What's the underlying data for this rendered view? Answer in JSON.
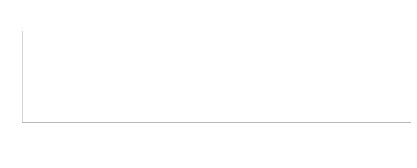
{
  "chart_data": {
    "type": "bar",
    "subtitle": "Completed surveys ranged from 201-235 for individual treatments",
    "xlabel": "",
    "ylabel": "",
    "grid": false,
    "legend_position": "none",
    "stacked": true,
    "ylim": [
      0,
      110
    ],
    "yticks": [
      0,
      10,
      20,
      30,
      40,
      50,
      60,
      70,
      80,
      90,
      100,
      110
    ],
    "ytick_labels": [
      "0",
      "10",
      "20",
      "30",
      "40",
      "50",
      "60",
      "70",
      "80",
      "90",
      "100",
      "110"
    ],
    "categories": [
      "Q1 Stretching Exercises",
      "Q2 Rest / Activity Modification",
      "Q3 Ice / Cold Therapy",
      "Q4 Over-The-Counter Orthotics",
      "Q5 Supportive Footwear",
      "Q6 Anti-Inflammatory Medication",
      "Q7 Night Splints",
      "Q8 Custom Orthotics",
      "Q9 Physical Therapy",
      "Q10 Massage / Foam Rolling",
      "Q11 Corticosteroid Injection",
      "Q12 Taping / Strapping",
      "Q13 Weight Loss",
      "Q14 Shockwave Therapy",
      "Q15 Dry Needling",
      "Q16 Platelet-Rich Plasma",
      "Q17 Laser Therapy",
      "Q18 Acupuncture",
      "Q19 Surgery",
      "Q20 Cryosurgery"
    ],
    "series": [
      {
        "name": "Helped",
        "color": "#8d8d8d",
        "values": [
          50,
          48,
          47,
          44,
          44,
          36,
          43,
          29,
          33,
          34,
          19,
          21,
          21,
          23,
          26,
          28,
          12,
          5,
          16,
          2
        ]
      },
      {
        "name": "No Change",
        "color": "#c7c7c7",
        "values": [
          48,
          34,
          44,
          34,
          33,
          22,
          34,
          22,
          47,
          38,
          24,
          22,
          20,
          21,
          42,
          41,
          11,
          3,
          21,
          2
        ]
      }
    ],
    "totals": [
      98,
      82,
      91,
      78,
      77,
      58,
      77,
      51,
      80,
      72,
      43,
      43,
      41,
      44,
      68,
      69,
      23,
      8,
      37,
      4
    ]
  }
}
